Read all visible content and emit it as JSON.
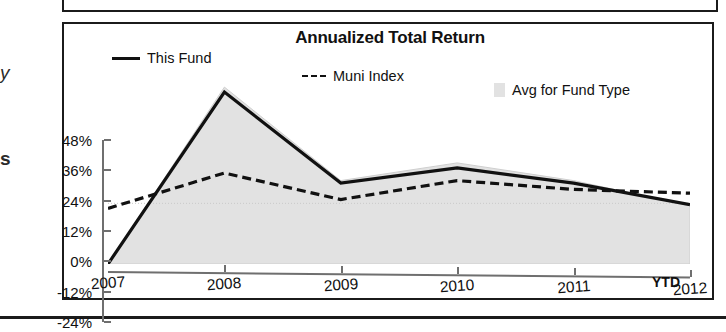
{
  "page": {
    "edge_fragments": [
      "y",
      "s"
    ]
  },
  "chart": {
    "title": "Annualized Total Return",
    "legend": [
      {
        "label": "This Fund",
        "key": "solid-line-key",
        "color": "#111111"
      },
      {
        "label": "Muni Index",
        "key": "dashed-line-key",
        "color": "#111111"
      },
      {
        "label": "Avg for Fund Type",
        "key": "gray-swatch-key",
        "color": "#e2e2e2"
      }
    ],
    "x_suffix_label": "YTD"
  },
  "chart_data": {
    "type": "line",
    "title": "Annualized Total Return",
    "xlabel": "",
    "ylabel": "",
    "categories": [
      "2007",
      "2008",
      "2009",
      "2010",
      "2011",
      "2012"
    ],
    "x_axis_note": "YTD",
    "ytick_labels": [
      "48%",
      "36%",
      "24%",
      "12%",
      "0%",
      "-12%",
      "-24%"
    ],
    "ytick_values": [
      48,
      36,
      24,
      12,
      0,
      -12,
      -24
    ],
    "ylim": [
      -24,
      48
    ],
    "grid": false,
    "legend_position": "top",
    "series": [
      {
        "name": "This Fund",
        "style": "solid",
        "color": "#111111",
        "values": [
          -24,
          44,
          8,
          14,
          8,
          -0.5
        ]
      },
      {
        "name": "Muni Index",
        "style": "dashed",
        "color": "#111111",
        "values": [
          -2,
          12,
          1.5,
          9,
          5.5,
          4
        ]
      },
      {
        "name": "Avg for Fund Type",
        "style": "shaded-band",
        "color": "#e2e2e2",
        "values": [
          -24,
          46,
          9,
          16,
          9,
          -1
        ]
      }
    ]
  }
}
